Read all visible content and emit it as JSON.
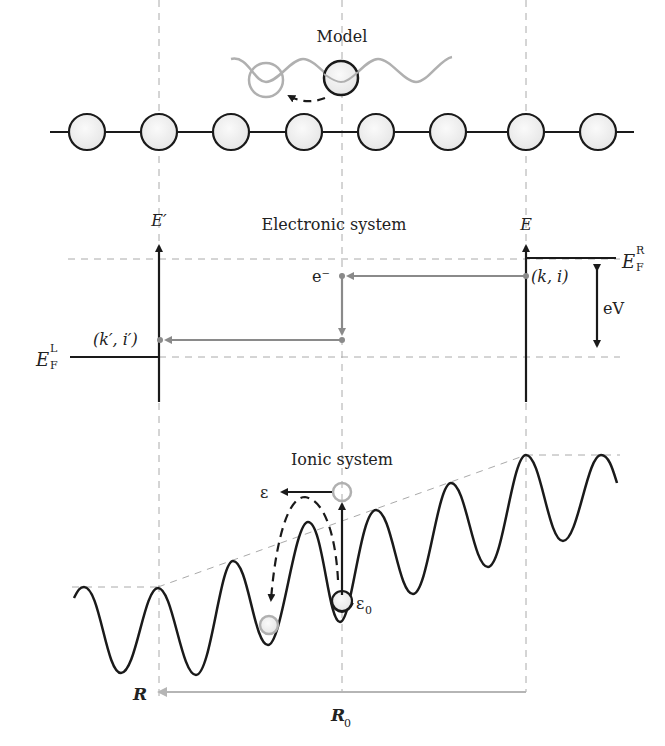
{
  "diagram": {
    "model": {
      "title": "Model",
      "atom_count": 8
    },
    "electronic": {
      "title": "Electronic system",
      "left_axis_label": "E′",
      "right_axis_label": "E",
      "fermi_left_main": "E",
      "fermi_left_sub": "F",
      "fermi_left_sup": "L",
      "fermi_right_main": "E",
      "fermi_right_sub": "F",
      "fermi_right_sup": "R",
      "electron_label": "e⁻",
      "initial_state": "(k, i)",
      "final_state": "(k′, i′)",
      "bias_label": "eV"
    },
    "ionic": {
      "title": "Ionic system",
      "energy_final": "ε",
      "energy_initial_main": "ε",
      "energy_initial_sub": "0",
      "coord_label": "R",
      "coord_origin_main": "R",
      "coord_origin_sub": "0"
    },
    "colors": {
      "line": "#1a1a1a",
      "gray": "#8a8a8a",
      "light_gray": "#b5b5b5",
      "dash": "#999999",
      "atom_fill": "#f0f0f0"
    }
  }
}
